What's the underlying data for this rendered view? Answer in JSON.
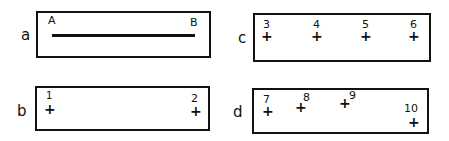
{
  "panels": {
    "a": {
      "label": "a",
      "start_label": "A",
      "end_label": "B"
    },
    "b": {
      "label": "b",
      "points": [
        {
          "id": "1",
          "mark": "+"
        },
        {
          "id": "2",
          "mark": "+"
        }
      ]
    },
    "c": {
      "label": "c",
      "points": [
        {
          "id": "3",
          "mark": "+"
        },
        {
          "id": "4",
          "mark": "+"
        },
        {
          "id": "5",
          "mark": "+"
        },
        {
          "id": "6",
          "mark": "+"
        }
      ]
    },
    "d": {
      "label": "d",
      "points": [
        {
          "id": "7",
          "mark": "+"
        },
        {
          "id": "8",
          "mark": "+"
        },
        {
          "id": "9",
          "mark": "+"
        },
        {
          "id": "10",
          "mark": "+"
        }
      ]
    }
  },
  "colors": {
    "ink": "#111111",
    "background": "#ffffff"
  }
}
